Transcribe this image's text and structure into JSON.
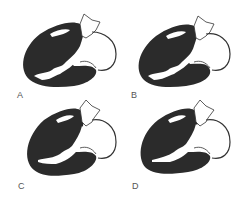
{
  "figure": {
    "panels": [
      {
        "id": "A",
        "label": "A"
      },
      {
        "id": "B",
        "label": "B"
      },
      {
        "id": "C",
        "label": "C"
      },
      {
        "id": "D",
        "label": "D"
      }
    ]
  },
  "colors": {
    "myocardium": "#2b2b2b",
    "outline": "#333333",
    "background": "#ffffff",
    "label": "#555555"
  }
}
